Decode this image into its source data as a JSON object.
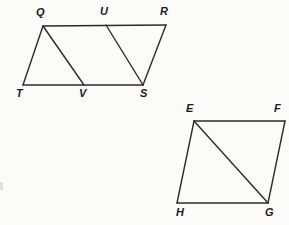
{
  "page": {
    "background_color": "#fbfbfa",
    "ink_color": "#2b2b2b",
    "width": 289,
    "height": 225
  },
  "figures": [
    {
      "id": "figure-qrst",
      "name": "parallelogram-qrstuv",
      "shape": "parallelogram with two interior diagonals",
      "vertices": [
        {
          "label": "Q",
          "x": 43,
          "y": 26,
          "label_x": 36,
          "label_y": 7
        },
        {
          "label": "U",
          "x": 106,
          "y": 25,
          "label_x": 100,
          "label_y": 6
        },
        {
          "label": "R",
          "x": 166,
          "y": 25,
          "label_x": 160,
          "label_y": 6
        },
        {
          "label": "T",
          "x": 23,
          "y": 85,
          "label_x": 16,
          "label_y": 88
        },
        {
          "label": "V",
          "x": 84,
          "y": 85,
          "label_x": 79,
          "label_y": 88
        },
        {
          "label": "S",
          "x": 143,
          "y": 85,
          "label_x": 140,
          "label_y": 88
        }
      ],
      "edges": [
        {
          "name": "edge-Q-R",
          "from": "Q",
          "to": "R",
          "kind": "edge"
        },
        {
          "name": "edge-T-S",
          "from": "T",
          "to": "S",
          "kind": "edge"
        },
        {
          "name": "edge-Q-T",
          "from": "Q",
          "to": "T",
          "kind": "edge"
        },
        {
          "name": "edge-R-S",
          "from": "R",
          "to": "S",
          "kind": "edge"
        },
        {
          "name": "diagonal-Q-V",
          "from": "Q",
          "to": "V",
          "kind": "diagonal"
        },
        {
          "name": "diagonal-U-S",
          "from": "U",
          "to": "S",
          "kind": "diagonal"
        }
      ]
    },
    {
      "id": "figure-efgh",
      "name": "quadrilateral-efgh",
      "shape": "quadrilateral with one diagonal",
      "vertices": [
        {
          "label": "E",
          "x": 194,
          "y": 121,
          "label_x": 186,
          "label_y": 103
        },
        {
          "label": "F",
          "x": 285,
          "y": 121,
          "label_x": 274,
          "label_y": 103
        },
        {
          "label": "H",
          "x": 177,
          "y": 203,
          "label_x": 176,
          "label_y": 207
        },
        {
          "label": "G",
          "x": 268,
          "y": 203,
          "label_x": 265,
          "label_y": 207
        }
      ],
      "edges": [
        {
          "name": "edge-E-F",
          "from": "E",
          "to": "F",
          "kind": "edge"
        },
        {
          "name": "edge-F-G",
          "from": "F",
          "to": "G",
          "kind": "edge"
        },
        {
          "name": "edge-G-H",
          "from": "G",
          "to": "H",
          "kind": "edge"
        },
        {
          "name": "edge-H-E",
          "from": "H",
          "to": "E",
          "kind": "edge"
        },
        {
          "name": "diagonal-E-G",
          "from": "E",
          "to": "G",
          "kind": "diagonal"
        }
      ]
    }
  ],
  "artifacts": [
    {
      "name": "scan-edge-mark",
      "x": 0,
      "y": 182,
      "width": 3,
      "height": 8
    }
  ]
}
